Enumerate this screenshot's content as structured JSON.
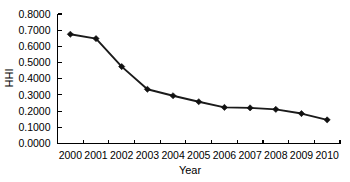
{
  "chart_data": {
    "type": "line",
    "title": "",
    "xlabel": "Year",
    "ylabel": "HHI",
    "x": [
      2000,
      2001,
      2002,
      2003,
      2004,
      2005,
      2006,
      2007,
      2008,
      2009,
      2010
    ],
    "categories": [
      "2000",
      "2001",
      "2002",
      "2003",
      "2004",
      "2005",
      "2006",
      "2007",
      "2008",
      "2009",
      "2010"
    ],
    "values": [
      0.675,
      0.648,
      0.475,
      0.335,
      0.295,
      0.258,
      0.223,
      0.22,
      0.211,
      0.185,
      0.146
    ],
    "series": [
      {
        "name": "HHI",
        "values": [
          0.675,
          0.648,
          0.475,
          0.335,
          0.295,
          0.258,
          0.223,
          0.22,
          0.211,
          0.185,
          0.146
        ]
      }
    ],
    "ylim": [
      0.0,
      0.8
    ],
    "ytick_step": 0.1,
    "ytick_labels": [
      "0.0000",
      "0.1000",
      "0.2000",
      "0.3000",
      "0.4000",
      "0.5000",
      "0.6000",
      "0.7000",
      "0.8000"
    ],
    "ytick_values": [
      0.0,
      0.1,
      0.2,
      0.3,
      0.4,
      0.5,
      0.6,
      0.7,
      0.8
    ],
    "xtick_labels": [
      "2000",
      "2001",
      "2002",
      "2003",
      "2004",
      "2005",
      "2006",
      "2007",
      "2008",
      "2009",
      "2010"
    ],
    "grid": false,
    "legend": false,
    "legend_position": "none",
    "marker": "diamond",
    "line_color": "#1a1a1a",
    "marker_color": "#111111",
    "background_color": "#ffffff"
  }
}
